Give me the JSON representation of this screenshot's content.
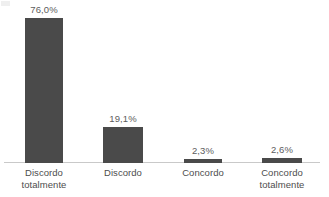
{
  "chart_data": {
    "type": "bar",
    "title": "",
    "subtitle": "",
    "xlabel": "",
    "ylabel": "",
    "categories": [
      "Discordo\ntotalmente",
      "Discordo",
      "Concordo",
      "Concordo\ntotalmente"
    ],
    "values": [
      76.0,
      19.1,
      2.3,
      2.6
    ],
    "value_labels": [
      "76,0%",
      "19,1%",
      "2,3%",
      "2,6%"
    ],
    "ylim": [
      0,
      85
    ],
    "grid": false,
    "legend": false,
    "legend_position": "none",
    "axis_line": true,
    "bar_color": "#4a4a4a",
    "value_label_color": "#5d5d5d",
    "category_label_color": "#4d4d4d",
    "background_color": "#ffffff"
  },
  "geometry": {
    "bars": [
      {
        "left": 25,
        "width": 38,
        "height_px": 145,
        "value_label_bottom": 148
      },
      {
        "left": 103,
        "width": 40,
        "height_px": 36,
        "value_label_bottom": 39
      },
      {
        "left": 184,
        "width": 38,
        "height_px": 4,
        "value_label_bottom": 7
      },
      {
        "left": 262,
        "width": 40,
        "height_px": 5,
        "value_label_bottom": 8
      }
    ],
    "category_label_slots": [
      {
        "left": 8,
        "width": 72
      },
      {
        "left": 87,
        "width": 72
      },
      {
        "left": 167,
        "width": 72
      },
      {
        "left": 246,
        "width": 72
      }
    ]
  }
}
